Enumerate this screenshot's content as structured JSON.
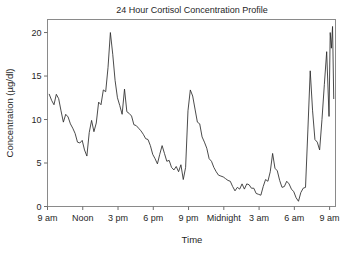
{
  "figure": {
    "width": 348,
    "height": 254,
    "background": "#ffffff",
    "line_color": "#2b2b2b",
    "frame_color": "#8a8a8a"
  },
  "chart_data": {
    "type": "line",
    "title": "24 Hour Cortisol Concentration Profile",
    "xlabel": "Time",
    "ylabel": "Concentration (µg/dl)",
    "xlim": [
      0,
      24.5
    ],
    "ylim": [
      0,
      21.5
    ],
    "ytick_values": [
      0,
      5,
      10,
      15,
      20
    ],
    "ytick_labels": [
      "0",
      "5",
      "10",
      "15",
      "20"
    ],
    "xtick_values": [
      0,
      3,
      6,
      9,
      12,
      15,
      18,
      21,
      24
    ],
    "xtick_labels": [
      "9 am",
      "Noon",
      "3 pm",
      "6 pm",
      "9 pm",
      "Midnight",
      "3 am",
      "6 am",
      "9 am"
    ],
    "grid": false,
    "legend": false,
    "series": [
      {
        "name": "Cortisol",
        "x": [
          0.15,
          0.35,
          0.55,
          0.75,
          0.95,
          1.15,
          1.35,
          1.55,
          1.75,
          1.95,
          2.15,
          2.35,
          2.55,
          2.75,
          2.95,
          3.15,
          3.35,
          3.55,
          3.75,
          3.95,
          4.15,
          4.35,
          4.55,
          4.75,
          4.95,
          5.15,
          5.35,
          5.55,
          5.75,
          5.95,
          6.15,
          6.35,
          6.55,
          6.75,
          6.95,
          7.15,
          7.35,
          7.55,
          7.75,
          7.95,
          8.15,
          8.35,
          8.55,
          8.75,
          8.95,
          9.15,
          9.35,
          9.55,
          9.75,
          9.95,
          10.15,
          10.35,
          10.55,
          10.75,
          10.95,
          11.15,
          11.35,
          11.55,
          11.75,
          11.95,
          12.15,
          12.35,
          12.55,
          12.75,
          12.95,
          13.15,
          13.35,
          13.55,
          13.75,
          13.95,
          14.15,
          14.35,
          14.55,
          14.75,
          14.95,
          15.15,
          15.35,
          15.55,
          15.75,
          15.95,
          16.15,
          16.35,
          16.55,
          16.75,
          16.95,
          17.15,
          17.35,
          17.55,
          17.75,
          17.95,
          18.15,
          18.35,
          18.55,
          18.75,
          18.95,
          19.15,
          19.35,
          19.55,
          19.75,
          19.95,
          20.15,
          20.35,
          20.55,
          20.75,
          20.95,
          21.15,
          21.35,
          21.55,
          21.75,
          21.95,
          22.15,
          22.35,
          22.55,
          22.75,
          22.95,
          23.15,
          23.35,
          23.55,
          23.75,
          23.95
        ],
        "y": [
          12.9,
          12.2,
          11.7,
          12.9,
          12.4,
          11.0,
          9.7,
          10.6,
          10.3,
          9.5,
          9.0,
          8.4,
          7.4,
          7.3,
          7.6,
          6.5,
          5.8,
          8.5,
          9.9,
          8.6,
          9.6,
          12.0,
          11.7,
          13.4,
          13.2,
          16.0,
          20.0,
          17.5,
          14.5,
          12.5,
          11.6,
          10.6,
          13.5,
          10.9,
          10.7,
          10.4,
          9.4,
          9.3,
          9.0,
          8.7,
          8.3,
          7.8,
          7.7,
          7.0,
          6.0,
          5.5,
          4.9,
          6.0,
          7.0,
          6.1,
          5.2,
          5.3,
          4.5,
          4.2,
          4.6,
          4.0,
          4.8,
          3.1,
          4.5,
          11.0,
          13.4,
          12.7,
          11.2,
          9.7,
          9.5,
          8.0,
          7.4,
          6.7,
          5.5,
          5.2,
          4.5,
          4.0,
          3.6,
          3.5,
          3.4,
          3.2,
          3.0,
          2.9,
          2.3,
          1.8,
          2.2,
          2.0,
          2.6,
          2.0,
          2.6,
          2.5,
          2.1,
          2.1,
          1.5,
          1.4,
          1.3,
          2.3,
          3.1,
          2.9,
          4.0,
          6.1,
          4.4,
          4.1,
          3.0,
          2.2,
          2.3,
          2.9,
          2.6,
          2.0,
          1.7,
          1.0,
          0.6,
          1.6,
          2.1,
          2.2,
          8.8,
          15.6,
          11.0,
          7.7,
          7.4,
          6.5,
          10.0,
          14.0,
          17.8,
          10.4
        ]
      },
      {
        "name": "Cortisol-cont",
        "x": [
          23.95,
          24.05,
          24.15,
          24.25,
          24.35
        ],
        "y": [
          10.4,
          20.0,
          18.2,
          20.7,
          12.4
        ]
      }
    ]
  }
}
